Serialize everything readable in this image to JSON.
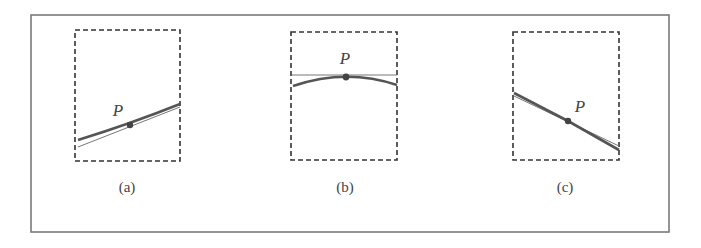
{
  "figure": {
    "frame": {
      "x": 31,
      "y": 15,
      "w": 638,
      "h": 217,
      "color": "#7a7a7a"
    },
    "colors": {
      "box": "#333333",
      "curve": "#555555",
      "tangent": "#777777",
      "point": "#444444"
    },
    "panels": [
      {
        "id": "a",
        "caption": "(a)",
        "point_label": "P",
        "box": {
          "x": 75,
          "y": 30,
          "w": 105,
          "h": 131
        },
        "point": {
          "x": 130,
          "y": 125
        },
        "label_pos": {
          "x": 118,
          "y": 116
        },
        "caption_pos": {
          "x": 127,
          "y": 192
        },
        "curve_path": "M 78 140 Q 130 124 180 104",
        "tangent": {
          "x1": 78,
          "y1": 147,
          "x2": 180,
          "y2": 107
        }
      },
      {
        "id": "b",
        "caption": "(b)",
        "point_label": "P",
        "box": {
          "x": 291,
          "y": 32,
          "w": 106,
          "h": 128
        },
        "point": {
          "x": 346,
          "y": 77
        },
        "label_pos": {
          "x": 345,
          "y": 64
        },
        "caption_pos": {
          "x": 345,
          "y": 192
        },
        "curve_path": "M 293 86 Q 346 68 397 85",
        "tangent": {
          "x1": 292,
          "y1": 75,
          "x2": 397,
          "y2": 75
        }
      },
      {
        "id": "c",
        "caption": "(c)",
        "point_label": "P",
        "box": {
          "x": 513,
          "y": 32,
          "w": 106,
          "h": 128
        },
        "point": {
          "x": 568,
          "y": 121
        },
        "label_pos": {
          "x": 580,
          "y": 112
        },
        "caption_pos": {
          "x": 565,
          "y": 192
        },
        "curve_path": "M 514 93 L 568 121 L 619 150",
        "tangent": {
          "x1": 514,
          "y1": 96,
          "x2": 619,
          "y2": 146
        }
      }
    ]
  }
}
